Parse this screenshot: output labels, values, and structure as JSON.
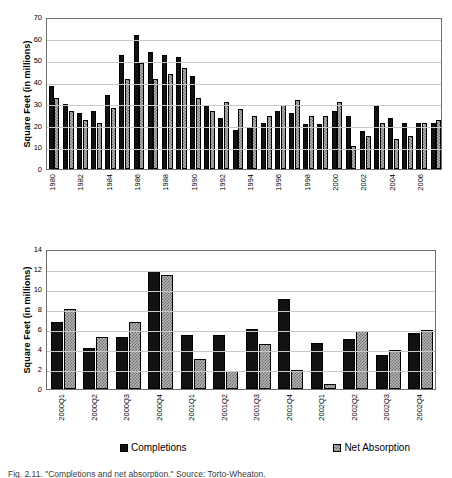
{
  "figure": {
    "caption": "Fig. 2.11.   \"Completions and net absorption.\" Source: Torto-Wheaton."
  },
  "legend": {
    "items": [
      {
        "label": "Completions",
        "style": "dark",
        "color": "#111111"
      },
      {
        "label": "Net Absorption",
        "style": "light",
        "color": "#b5b5b5"
      }
    ]
  },
  "chart_data": [
    {
      "id": "annual-chart",
      "type": "bar",
      "title": "",
      "xlabel": "",
      "ylabel": "Square Feet (in millions)",
      "ylim": [
        0,
        70
      ],
      "yticks": [
        0,
        10,
        20,
        30,
        40,
        50,
        60,
        70
      ],
      "grid": true,
      "legend_position": "below-figure",
      "categories": [
        "1980",
        "1981",
        "1982",
        "1983",
        "1984",
        "1985",
        "1986",
        "1987",
        "1988",
        "1989",
        "1990",
        "1991",
        "1992",
        "1993",
        "1994",
        "1995",
        "1996",
        "1997",
        "1998",
        "1999",
        "2000",
        "2001",
        "2002",
        "2003",
        "2004",
        "2005",
        "2006",
        "2007"
      ],
      "tick_labels_shown": [
        "1980",
        "1982",
        "1984",
        "1986",
        "1988",
        "1990",
        "1992",
        "1994",
        "1996",
        "1998",
        "2000",
        "2002",
        "2004",
        "2006"
      ],
      "series": [
        {
          "name": "Completions",
          "values": [
            38.2,
            29.8,
            25.7,
            26.9,
            33.9,
            52.6,
            61.6,
            53.7,
            52.5,
            51.6,
            42.8,
            29.7,
            23.6,
            17.8,
            19.5,
            21.3,
            26.8,
            25.6,
            20.7,
            20.8,
            26.7,
            24.3,
            17.6,
            29.7,
            23.5,
            21.3,
            21.3,
            21.3
          ]
        },
        {
          "name": "Net Absorption",
          "values": [
            32.7,
            26.8,
            22.6,
            21.3,
            27.9,
            41.6,
            48.7,
            41.6,
            43.9,
            46.7,
            32.7,
            26.6,
            30.9,
            27.8,
            24.5,
            24.4,
            29.7,
            31.6,
            24.4,
            24.4,
            30.8,
            10.7,
            15.3,
            21.4,
            13.7,
            15.4,
            21.3,
            22.5
          ]
        }
      ]
    },
    {
      "id": "quarterly-chart",
      "type": "bar",
      "title": "",
      "xlabel": "",
      "ylabel": "Square Feet (in millions)",
      "ylim": [
        0,
        14
      ],
      "yticks": [
        0,
        2,
        4,
        6,
        8,
        10,
        12,
        14
      ],
      "grid": true,
      "legend_position": "bottom",
      "categories": [
        "2000Q1",
        "2000Q2",
        "2000Q3",
        "2000Q4",
        "2001Q1",
        "2001Q2",
        "2001Q3",
        "2001Q4",
        "2002Q1",
        "2002Q2",
        "2002Q3",
        "2002Q4"
      ],
      "tick_labels_shown": [
        "2000Q1",
        "2000Q2",
        "2000Q3",
        "2000Q4",
        "2001Q1",
        "2001Q2",
        "2001Q3",
        "2001Q4",
        "2002Q1",
        "2002Q2",
        "2002Q3",
        "2002Q4"
      ],
      "series": [
        {
          "name": "Completions",
          "values": [
            6.7,
            4.1,
            5.2,
            11.8,
            5.4,
            5.4,
            6.0,
            9.0,
            4.6,
            5.0,
            3.4,
            5.6
          ]
        },
        {
          "name": "Net Absorption",
          "values": [
            8.0,
            5.2,
            6.7,
            11.4,
            3.0,
            1.8,
            4.5,
            1.9,
            0.55,
            5.8,
            3.9,
            5.9
          ]
        }
      ]
    }
  ]
}
